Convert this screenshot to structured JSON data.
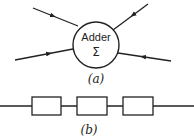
{
  "figure_a": {
    "node_label": "Adder",
    "node_symbol": "Σ",
    "caption": "(a)",
    "inputs": 3,
    "outputs": 1
  },
  "figure_b": {
    "caption": "(b)",
    "block_count": 3
  },
  "colors": {
    "stroke": "#222222",
    "background": "#ffffff"
  }
}
